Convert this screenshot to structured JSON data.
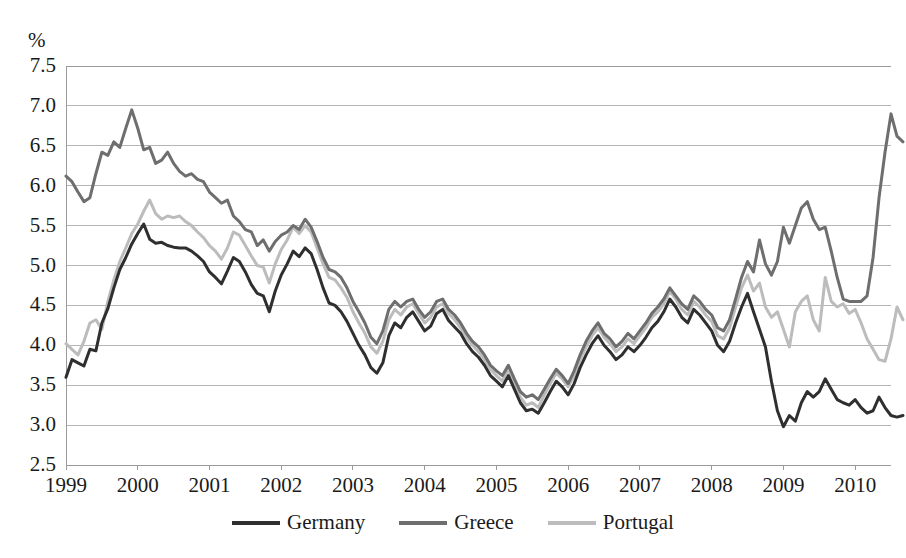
{
  "chart_data": {
    "type": "line",
    "title": "",
    "subtitle": "",
    "xlabel": "",
    "ylabel": "%",
    "ylim": [
      2.5,
      7.5
    ],
    "ytick_step": 0.5,
    "yticks": [
      "7.5",
      "7.0",
      "6.5",
      "6.0",
      "5.5",
      "5.0",
      "4.5",
      "4.0",
      "3.5",
      "3.0",
      "2.5"
    ],
    "xlim": [
      1999.0,
      2010.5
    ],
    "xticks": [
      "1999",
      "2000",
      "2001",
      "2002",
      "2003",
      "2004",
      "2005",
      "2006",
      "2007",
      "2008",
      "2009",
      "2010"
    ],
    "grid": "horizontal",
    "legend_position": "bottom-center",
    "x_start": 1999.0,
    "x_step": 0.08333333,
    "series": [
      {
        "name": "Germany",
        "color": "#2f2f2f",
        "values": [
          3.6,
          3.82,
          3.78,
          3.74,
          3.95,
          3.93,
          4.28,
          4.46,
          4.72,
          4.95,
          5.1,
          5.27,
          5.4,
          5.52,
          5.33,
          5.28,
          5.29,
          5.25,
          5.23,
          5.22,
          5.22,
          5.18,
          5.12,
          5.05,
          4.92,
          4.85,
          4.77,
          4.93,
          5.1,
          5.05,
          4.92,
          4.76,
          4.65,
          4.62,
          4.42,
          4.68,
          4.88,
          5.02,
          5.18,
          5.11,
          5.22,
          5.15,
          4.95,
          4.72,
          4.53,
          4.5,
          4.42,
          4.3,
          4.15,
          4.0,
          3.88,
          3.72,
          3.65,
          3.78,
          4.12,
          4.28,
          4.22,
          4.35,
          4.42,
          4.3,
          4.18,
          4.24,
          4.4,
          4.45,
          4.31,
          4.23,
          4.15,
          4.02,
          3.92,
          3.85,
          3.75,
          3.62,
          3.55,
          3.48,
          3.62,
          3.45,
          3.28,
          3.18,
          3.2,
          3.15,
          3.28,
          3.42,
          3.55,
          3.48,
          3.38,
          3.52,
          3.72,
          3.88,
          4.02,
          4.12,
          4.0,
          3.92,
          3.82,
          3.88,
          3.98,
          3.92,
          4.0,
          4.1,
          4.22,
          4.3,
          4.42,
          4.58,
          4.48,
          4.35,
          4.28,
          4.45,
          4.38,
          4.28,
          4.18,
          4.0,
          3.92,
          4.05,
          4.28,
          4.48,
          4.65,
          4.42,
          4.2,
          3.98,
          3.55,
          3.18,
          2.98,
          3.12,
          3.05,
          3.28,
          3.42,
          3.35,
          3.42,
          3.58,
          3.45,
          3.32,
          3.28,
          3.25,
          3.32,
          3.22,
          3.15,
          3.18,
          3.35,
          3.22,
          3.12,
          3.1,
          3.12
        ]
      },
      {
        "name": "Greece",
        "color": "#6e6e6e",
        "values": [
          6.12,
          6.05,
          5.92,
          5.8,
          5.85,
          6.15,
          6.42,
          6.38,
          6.55,
          6.48,
          6.72,
          6.95,
          6.72,
          6.45,
          6.48,
          6.28,
          6.32,
          6.42,
          6.28,
          6.18,
          6.12,
          6.15,
          6.08,
          6.05,
          5.92,
          5.85,
          5.78,
          5.82,
          5.62,
          5.55,
          5.45,
          5.42,
          5.25,
          5.32,
          5.18,
          5.3,
          5.38,
          5.42,
          5.5,
          5.45,
          5.58,
          5.48,
          5.3,
          5.1,
          4.95,
          4.92,
          4.85,
          4.72,
          4.55,
          4.42,
          4.28,
          4.1,
          4.02,
          4.18,
          4.45,
          4.55,
          4.48,
          4.55,
          4.58,
          4.45,
          4.35,
          4.42,
          4.55,
          4.58,
          4.45,
          4.38,
          4.28,
          4.15,
          4.05,
          3.98,
          3.88,
          3.75,
          3.68,
          3.62,
          3.75,
          3.58,
          3.42,
          3.35,
          3.38,
          3.32,
          3.45,
          3.58,
          3.7,
          3.62,
          3.52,
          3.68,
          3.88,
          4.05,
          4.18,
          4.28,
          4.15,
          4.08,
          3.98,
          4.05,
          4.15,
          4.08,
          4.18,
          4.28,
          4.4,
          4.48,
          4.58,
          4.72,
          4.62,
          4.52,
          4.45,
          4.62,
          4.55,
          4.45,
          4.38,
          4.22,
          4.18,
          4.32,
          4.58,
          4.85,
          5.05,
          4.92,
          5.32,
          5.02,
          4.88,
          5.05,
          5.48,
          5.28,
          5.5,
          5.72,
          5.8,
          5.58,
          5.45,
          5.48,
          5.18,
          4.85,
          4.58,
          4.55,
          4.55,
          4.55,
          4.62,
          5.1,
          5.85,
          6.42,
          6.9,
          6.62,
          6.55
        ]
      },
      {
        "name": "Portugal",
        "color": "#bcbcbc",
        "values": [
          4.02,
          3.95,
          3.88,
          4.05,
          4.28,
          4.32,
          4.2,
          4.55,
          4.82,
          5.05,
          5.22,
          5.4,
          5.52,
          5.68,
          5.82,
          5.65,
          5.58,
          5.62,
          5.6,
          5.62,
          5.55,
          5.5,
          5.42,
          5.35,
          5.25,
          5.18,
          5.08,
          5.22,
          5.42,
          5.38,
          5.25,
          5.12,
          5.0,
          4.98,
          4.78,
          5.02,
          5.2,
          5.32,
          5.48,
          5.4,
          5.5,
          5.42,
          5.22,
          5.02,
          4.85,
          4.82,
          4.72,
          4.6,
          4.42,
          4.28,
          4.15,
          3.98,
          3.9,
          4.05,
          4.32,
          4.45,
          4.38,
          4.48,
          4.52,
          4.4,
          4.28,
          4.35,
          4.48,
          4.52,
          4.4,
          4.32,
          4.22,
          4.1,
          4.0,
          3.92,
          3.82,
          3.7,
          3.62,
          3.55,
          3.7,
          3.52,
          3.35,
          3.25,
          3.28,
          3.22,
          3.38,
          3.52,
          3.65,
          3.58,
          3.48,
          3.62,
          3.82,
          3.98,
          4.12,
          4.22,
          4.1,
          4.02,
          3.92,
          3.98,
          4.08,
          4.02,
          4.12,
          4.22,
          4.35,
          4.42,
          4.52,
          4.68,
          4.58,
          4.45,
          4.38,
          4.55,
          4.48,
          4.38,
          4.3,
          4.12,
          4.08,
          4.22,
          4.48,
          4.72,
          4.88,
          4.68,
          4.78,
          4.48,
          4.35,
          4.42,
          4.2,
          3.98,
          4.42,
          4.55,
          4.62,
          4.32,
          4.18,
          4.85,
          4.55,
          4.48,
          4.52,
          4.4,
          4.45,
          4.28,
          4.08,
          3.95,
          3.82,
          3.8,
          4.08,
          4.48,
          4.32
        ]
      }
    ]
  },
  "axis": {
    "y_unit": "%"
  },
  "legend": {
    "entries": [
      {
        "label": "Germany",
        "color": "#2f2f2f"
      },
      {
        "label": "Greece",
        "color": "#6e6e6e"
      },
      {
        "label": "Portugal",
        "color": "#bcbcbc"
      }
    ]
  },
  "colors": {
    "germany": "#2f2f2f",
    "greece": "#6e6e6e",
    "portugal": "#bcbcbc",
    "gridline": "#b5b5b5",
    "axis": "#9a9a9a",
    "text": "#1a1a1a",
    "background": "#ffffff"
  }
}
